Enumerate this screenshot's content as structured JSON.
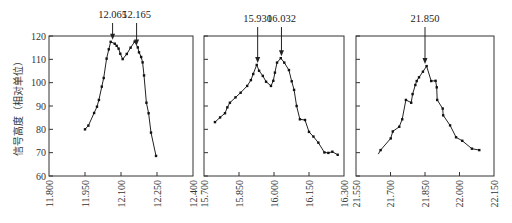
{
  "figure": {
    "ylabel": "信号高度（相对单位）",
    "yticks": [
      60,
      70,
      80,
      90,
      100,
      110,
      120
    ]
  },
  "chart_data": [
    {
      "type": "line",
      "title": "",
      "xlabel": "",
      "ylabel": "信号高度（相对单位）",
      "xlim": [
        11.8,
        12.4
      ],
      "ylim": [
        60,
        120
      ],
      "xticks": [
        "11.800",
        "11.950",
        "12.100",
        "12.250",
        "12.400"
      ],
      "yticks": [
        60,
        70,
        80,
        90,
        100,
        110,
        120
      ],
      "grid": false,
      "annotations": [
        {
          "label": "12.065",
          "x": 12.065
        },
        {
          "label": "12.165",
          "x": 12.165
        }
      ],
      "x": [
        11.95,
        11.964,
        11.988,
        12.0,
        12.008,
        12.02,
        12.028,
        12.04,
        12.049,
        12.057,
        12.074,
        12.082,
        12.09,
        12.097,
        12.107,
        12.124,
        12.14,
        12.157,
        12.17,
        12.175,
        12.184,
        12.19,
        12.196,
        12.206,
        12.215,
        12.225,
        12.246
      ],
      "y": [
        80.0,
        81.6,
        87.0,
        89.7,
        92.6,
        98.3,
        102.0,
        110.3,
        114.3,
        117.5,
        116.7,
        115.8,
        114.6,
        112.4,
        110.1,
        112.3,
        115.0,
        117.6,
        115.1,
        113.0,
        111.0,
        108.7,
        103.1,
        91.4,
        86.9,
        78.6,
        68.6
      ]
    },
    {
      "type": "line",
      "title": "",
      "xlabel": "",
      "ylabel": "",
      "xlim": [
        15.7,
        16.3
      ],
      "ylim": [
        60,
        120
      ],
      "xticks": [
        "15.700",
        "15.850",
        "16.000",
        "16.150",
        "16.300"
      ],
      "yticks": [
        60,
        70,
        80,
        90,
        100,
        110,
        120
      ],
      "grid": false,
      "annotations": [
        {
          "label": "15.930",
          "x": 15.93
        },
        {
          "label": "16.032",
          "x": 16.032
        }
      ],
      "x": [
        15.747,
        15.769,
        15.79,
        15.8,
        15.811,
        15.835,
        15.857,
        15.885,
        15.901,
        15.911,
        15.926,
        15.936,
        15.952,
        15.966,
        15.987,
        15.997,
        16.004,
        16.013,
        16.029,
        16.044,
        16.064,
        16.076,
        16.086,
        16.097,
        16.111,
        16.133,
        16.15,
        16.169,
        16.19,
        16.216,
        16.233,
        16.25,
        16.273
      ],
      "y": [
        83.1,
        85.1,
        86.9,
        89.4,
        91.4,
        93.7,
        95.7,
        98.6,
        101.1,
        103.7,
        107.6,
        105.1,
        102.9,
        100.4,
        98.6,
        100.8,
        104.3,
        108.6,
        110.5,
        108.6,
        105.4,
        100.6,
        96.9,
        90.0,
        84.3,
        84.0,
        78.9,
        76.9,
        74.3,
        70.1,
        69.9,
        70.4,
        69.1
      ]
    },
    {
      "type": "line",
      "title": "",
      "xlabel": "",
      "ylabel": "",
      "xlim": [
        21.55,
        22.15
      ],
      "ylim": [
        60,
        120
      ],
      "xticks": [
        "21.550",
        "21.700",
        "21.850",
        "22.000",
        "22.150"
      ],
      "yticks": [
        60,
        70,
        80,
        90,
        100,
        110,
        120
      ],
      "grid": false,
      "annotations": [
        {
          "label": "21.850",
          "x": 21.85
        }
      ],
      "x": [
        21.657,
        21.701,
        21.71,
        21.738,
        21.751,
        21.767,
        21.79,
        21.796,
        21.808,
        21.814,
        21.824,
        21.841,
        21.857,
        21.877,
        21.896,
        21.901,
        21.903,
        21.927,
        21.929,
        21.959,
        21.985,
        22.012,
        22.054,
        22.086
      ],
      "y": [
        71.1,
        76.1,
        79.1,
        81.1,
        84.3,
        92.6,
        91.4,
        95.1,
        99.0,
        100.7,
        102.3,
        104.7,
        107.1,
        100.7,
        100.8,
        98.0,
        92.6,
        88.9,
        86.0,
        81.7,
        76.6,
        75.1,
        71.7,
        71.1
      ],
      "line_start": {
        "x": 21.647,
        "y": 69.4
      }
    }
  ]
}
